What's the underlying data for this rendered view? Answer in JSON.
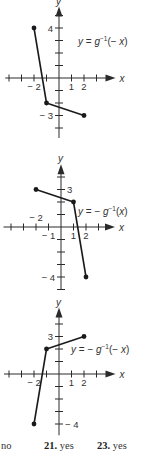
{
  "chart_data": [
    {
      "type": "line",
      "title": "y = g⁻¹(−x)",
      "label_parts": {
        "pre": "y = ",
        "func": "g",
        "sup": "−1",
        "arg": "(− x)"
      },
      "points": [
        [
          -2,
          4
        ],
        [
          -1,
          -2
        ],
        [
          2,
          -3
        ]
      ],
      "xlabel": "x",
      "ylabel": "y",
      "x_tick_labels": [
        {
          "v": -2,
          "text": "− 2",
          "side": "below"
        },
        {
          "v": 1,
          "text": "1",
          "side": "below"
        },
        {
          "v": 2,
          "text": "2",
          "side": "below"
        }
      ],
      "y_tick_labels": [
        {
          "v": 4,
          "text": "4",
          "side": "left"
        },
        {
          "v": -3,
          "text": "− 3",
          "side": "left"
        }
      ],
      "xlim": [
        -4,
        4
      ],
      "ylim": [
        -4.5,
        5.5
      ],
      "grid": false,
      "layout": {
        "ox": 59,
        "oy": 78,
        "unit": 12.5,
        "xmin": -4.3,
        "xmax": 4.2,
        "ymin": -4.8,
        "ymax": 5.4,
        "label_x": 78,
        "label_y": 45
      }
    },
    {
      "type": "line",
      "title": "y = −g⁻¹(x)",
      "label_parts": {
        "pre": "y = − ",
        "func": "g",
        "sup": "−1",
        "arg": "(x)"
      },
      "points": [
        [
          -2,
          3
        ],
        [
          1,
          2
        ],
        [
          2,
          -4
        ]
      ],
      "xlabel": "x",
      "ylabel": "y",
      "x_tick_labels": [
        {
          "v": -2,
          "text": "− 2",
          "side": "above"
        },
        {
          "v": -1,
          "text": "− 1",
          "side": "below"
        },
        {
          "v": 1,
          "text": "1",
          "side": "below"
        },
        {
          "v": 2,
          "text": "2",
          "side": "below"
        }
      ],
      "y_tick_labels": [
        {
          "v": 3,
          "text": "3",
          "side": "right"
        },
        {
          "v": -4,
          "text": "− 4",
          "side": "left"
        }
      ],
      "xlim": [
        -4,
        4
      ],
      "ylim": [
        -5,
        5
      ],
      "grid": false,
      "layout": {
        "ox": 61,
        "oy": 227,
        "unit": 12.5,
        "xmin": -4.6,
        "xmax": 4.0,
        "ymin": -5.0,
        "ymax": 4.7,
        "label_x": 78,
        "label_y": 215
      }
    },
    {
      "type": "line",
      "title": "y = −g⁻¹(−x)",
      "label_parts": {
        "pre": "y = − ",
        "func": "g",
        "sup": "−1",
        "arg": "(− x)"
      },
      "points": [
        [
          -2,
          -4
        ],
        [
          -1,
          2
        ],
        [
          2,
          3
        ]
      ],
      "xlabel": "x",
      "ylabel": "y",
      "x_tick_labels": [
        {
          "v": -2,
          "text": "− 2",
          "side": "below"
        },
        {
          "v": 1,
          "text": "1",
          "side": "below"
        },
        {
          "v": 2,
          "text": "2",
          "side": "below"
        }
      ],
      "y_tick_labels": [
        {
          "v": 3,
          "text": "3",
          "side": "left"
        },
        {
          "v": -4,
          "text": "− 4",
          "side": "right"
        }
      ],
      "xlim": [
        -4,
        4
      ],
      "ylim": [
        -5,
        5
      ],
      "grid": false,
      "layout": {
        "ox": 59,
        "oy": 374,
        "unit": 12.5,
        "xmin": -4.4,
        "xmax": 4.2,
        "ymin": -4.9,
        "ymax": 5.0,
        "label_x": 71,
        "label_y": 353
      }
    }
  ],
  "answers": [
    {
      "num": "",
      "text": "no",
      "x": 1
    },
    {
      "num": "21.",
      "text": " yes",
      "x": 44
    },
    {
      "num": "23.",
      "text": " yes",
      "x": 97
    }
  ]
}
